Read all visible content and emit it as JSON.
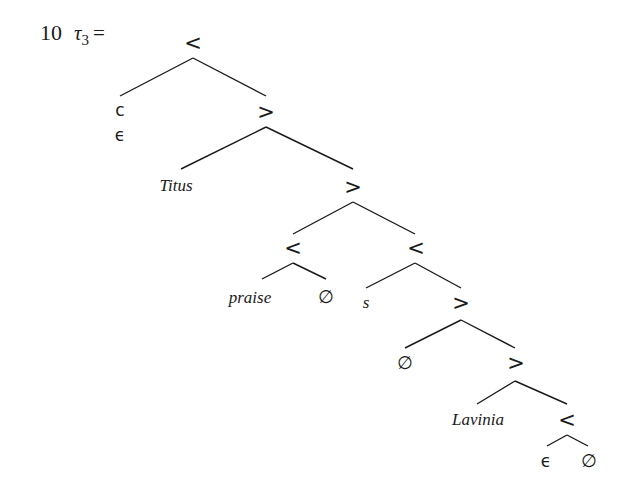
{
  "example": {
    "number": "10",
    "label": "τ₃ =",
    "label_base": "τ",
    "label_sub": "3",
    "label_eq": "="
  },
  "tree": {
    "nodes": [
      {
        "id": "n0",
        "label": "<",
        "x": 193,
        "y": 44,
        "style": "sans"
      },
      {
        "id": "n1",
        "label": "c",
        "x": 119,
        "y": 112,
        "style": "sans",
        "sublabel": "ϵ"
      },
      {
        "id": "n2",
        "label": ">",
        "x": 266,
        "y": 113,
        "style": "sans"
      },
      {
        "id": "n3",
        "label": "Titus",
        "x": 160,
        "y": 189,
        "style": "italic"
      },
      {
        "id": "n4",
        "label": ">",
        "x": 353,
        "y": 190,
        "style": "sans"
      },
      {
        "id": "n5",
        "label": "<",
        "x": 293,
        "y": 251,
        "style": "sans"
      },
      {
        "id": "n6",
        "label": "praise",
        "x": 247,
        "y": 303,
        "style": "italic"
      },
      {
        "id": "n7",
        "label": "∅",
        "x": 326,
        "y": 301,
        "style": "sans"
      },
      {
        "id": "n8",
        "label": "<",
        "x": 415,
        "y": 251,
        "style": "sans"
      },
      {
        "id": "n9",
        "label": "s",
        "x": 366,
        "y": 308,
        "style": "italic"
      },
      {
        "id": "n10",
        "label": ">",
        "x": 461,
        "y": 307,
        "style": "sans"
      },
      {
        "id": "n11",
        "label": "∅",
        "x": 405,
        "y": 367,
        "style": "sans"
      },
      {
        "id": "n12",
        "label": ">",
        "x": 515,
        "y": 364,
        "style": "sans"
      },
      {
        "id": "n13",
        "label": "Lavinia",
        "x": 478,
        "y": 423,
        "style": "italic"
      },
      {
        "id": "n14",
        "label": "<",
        "x": 567,
        "y": 423,
        "style": "sans"
      },
      {
        "id": "n15",
        "label": "ϵ",
        "x": 546,
        "y": 466,
        "style": "sans"
      },
      {
        "id": "n16",
        "label": "∅",
        "x": 589,
        "y": 466,
        "style": "sans"
      }
    ],
    "labels": {
      "root": "<",
      "c": "c",
      "c_epsilon": "ϵ",
      "gt1": ">",
      "titus": "Titus",
      "gt2": ">",
      "lt_praise": "<",
      "praise": "praise",
      "empty1": "∅",
      "lt_s": "<",
      "s": "s",
      "gt3": ">",
      "empty2": "∅",
      "gt4": ">",
      "lavinia": "Lavinia",
      "lt_final": "<",
      "epsilon_final": "ϵ",
      "empty3": "∅"
    }
  }
}
